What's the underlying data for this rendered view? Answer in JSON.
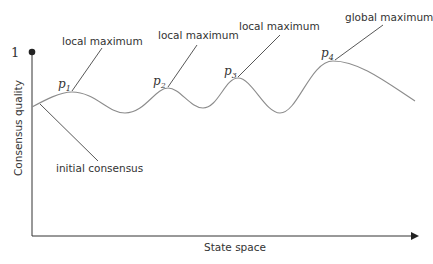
{
  "diagram": {
    "y_axis_label": "Consensus quality",
    "x_axis_label": "State space",
    "y_max_tick": "1",
    "annotations": [
      {
        "id": "initial",
        "label": "initial consensus"
      },
      {
        "id": "p1",
        "label": "local maximum",
        "point": "p",
        "sub": "1"
      },
      {
        "id": "p2",
        "label": "local maximum",
        "point": "p",
        "sub": "2"
      },
      {
        "id": "p3",
        "label": "local maximum",
        "point": "p",
        "sub": "3"
      },
      {
        "id": "p4",
        "label": "global maximum",
        "point": "p",
        "sub": "4"
      }
    ],
    "colors": {
      "axis": "#333333",
      "curve": "#8c8c8c",
      "leader": "#444444",
      "text": "#333333"
    }
  }
}
